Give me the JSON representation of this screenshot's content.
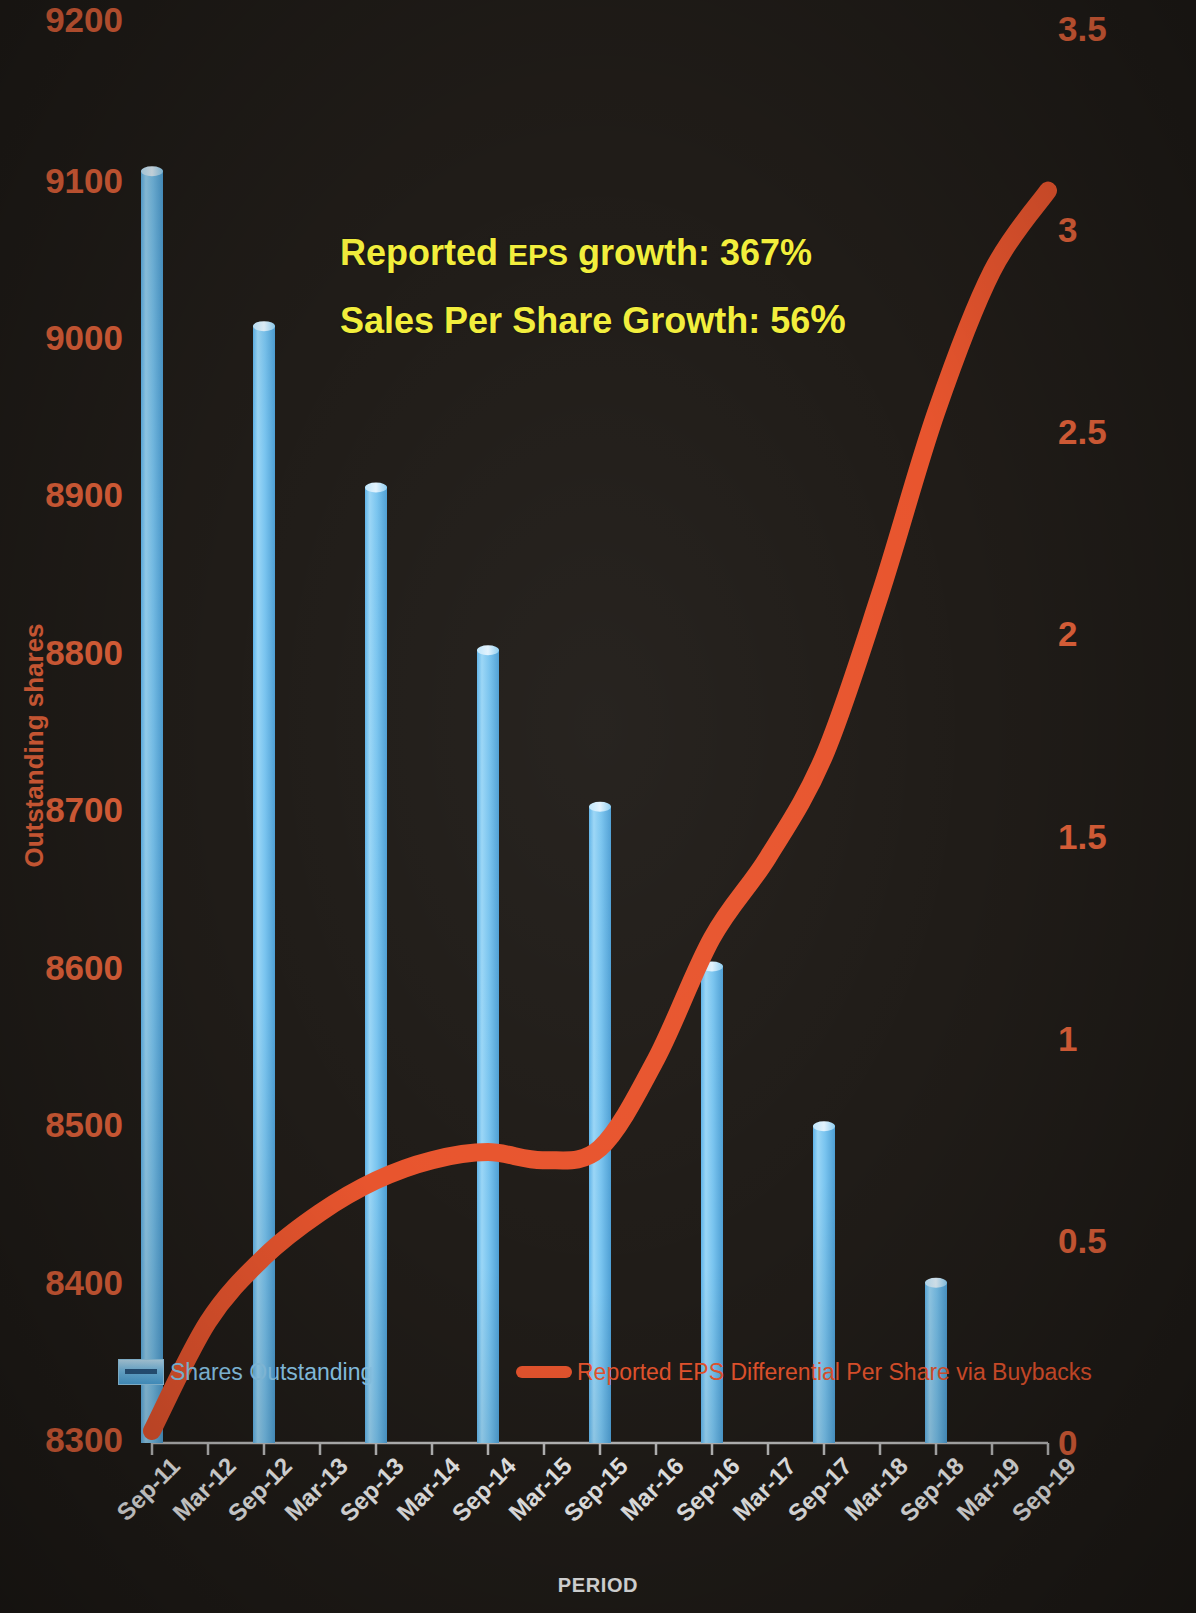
{
  "chart_data": {
    "type": "bar",
    "title": "",
    "xlabel": "PERIOD",
    "ylabel": "Outstanding shares",
    "y2label": "REPORTED EPS DIFFERENTIAL",
    "grid": false,
    "legend_position": "bottom-inside",
    "categories": [
      "Sep-11",
      "Mar-12",
      "Sep-12",
      "Mar-13",
      "Sep-13",
      "Mar-14",
      "Sep-14",
      "Mar-15",
      "Sep-15",
      "Mar-16",
      "Sep-16",
      "Mar-17",
      "Sep-17",
      "Mar-18",
      "Sep-18",
      "Mar-19",
      "Sep-19"
    ],
    "ylim": [
      8300,
      9200
    ],
    "yticks": [
      "9200",
      "9100",
      "9000",
      "8900",
      "8800",
      "8700",
      "8600",
      "8500",
      "8400",
      "8300"
    ],
    "y2lim": [
      0,
      3.5
    ],
    "y2ticks": [
      "3.5",
      "3",
      "2.5",
      "2",
      "1.5",
      "1",
      "0.5",
      "0"
    ],
    "series": [
      {
        "name": "Shares Outstanding",
        "type": "bar",
        "axis": "left",
        "color": "#79c4ef",
        "x": [
          "Sep-11",
          "Sep-12",
          "Sep-13",
          "Sep-14",
          "Sep-15",
          "Sep-16",
          "Sep-17",
          "Sep-18"
        ],
        "values": [
          9105,
          9007,
          8905,
          8802,
          8703,
          8602,
          8501,
          8402
        ]
      },
      {
        "name": "Reported EPS Differential Per Share via Buybacks",
        "type": "line",
        "axis": "right",
        "color": "#e8552e",
        "x": [
          "Sep-11",
          "Mar-12",
          "Sep-12",
          "Mar-13",
          "Sep-13",
          "Mar-14",
          "Sep-14",
          "Mar-15",
          "Sep-15",
          "Mar-16",
          "Sep-16",
          "Mar-17",
          "Sep-17",
          "Mar-18",
          "Sep-18",
          "Mar-19",
          "Sep-19"
        ],
        "values": [
          0.03,
          0.3,
          0.46,
          0.57,
          0.65,
          0.7,
          0.72,
          0.7,
          0.73,
          0.95,
          1.25,
          1.45,
          1.7,
          2.1,
          2.55,
          2.9,
          3.1
        ]
      }
    ],
    "annotations": [
      {
        "text_parts": [
          "Reported ",
          "EPS",
          " growth: ",
          "367%"
        ],
        "full": "Reported EPS growth: 367%",
        "color": "#f2ee3c"
      },
      {
        "text_parts": [
          "Sales Per  Share Growth: ",
          "56%"
        ],
        "full": "Sales Per  Share Growth: 56%",
        "color": "#f2ee3c"
      }
    ]
  },
  "axes": {
    "left_title": "Outstanding shares",
    "right_title": "REPORTED EPS DIFFERENTIAL",
    "x_title": "PERIOD",
    "left_ticks": [
      "9200",
      "9100",
      "9000",
      "8900",
      "8800",
      "8700",
      "8600",
      "8500",
      "8400",
      "8300"
    ],
    "right_ticks": [
      "3.5",
      "3",
      "2.5",
      "2",
      "1.5",
      "1",
      "0.5",
      "0"
    ],
    "x_ticks": [
      "Sep-11",
      "Mar-12",
      "Sep-12",
      "Mar-13",
      "Sep-13",
      "Mar-14",
      "Sep-14",
      "Mar-15",
      "Sep-15",
      "Mar-16",
      "Sep-16",
      "Mar-17",
      "Sep-17",
      "Mar-18",
      "Sep-18",
      "Mar-19",
      "Sep-19"
    ]
  },
  "annotation": {
    "line1_a": "Reported ",
    "line1_b": "EPS",
    "line1_c": " growth: ",
    "line1_d": "367",
    "line1_e": "%",
    "line2_a": "Sales Per  Share Growth: ",
    "line2_b": "56",
    "line2_c": "%"
  },
  "legend": {
    "bars_label": "Shares Outstanding",
    "line_label": "Reported EPS Differential Per Share via Buybacks"
  },
  "colors": {
    "background": "#201c18",
    "bar": "#79c4ef",
    "line": "#e8552e",
    "axis_text_orange": "#e2623a",
    "axis_text_white": "#f2f2f2",
    "annotation_yellow": "#f2ee3c"
  }
}
